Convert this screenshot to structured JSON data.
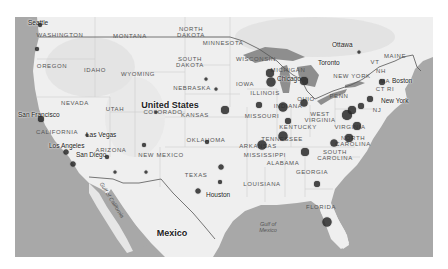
{
  "map": {
    "style": "grayscale",
    "colors": {
      "land": "#efefef",
      "water": "#a8a8a8",
      "lakes": "#8e8e8e",
      "border": "#555555",
      "marker": "#2a2a2a"
    },
    "country_labels": [
      {
        "text": "United States",
        "x": 170,
        "y": 105
      },
      {
        "text": "Mexico",
        "x": 172,
        "y": 233
      }
    ],
    "region_labels": [
      {
        "text": "WASHINGTON",
        "x": 60,
        "y": 35
      },
      {
        "text": "MONTANA",
        "x": 130,
        "y": 36
      },
      {
        "text": "OREGON",
        "x": 52,
        "y": 66
      },
      {
        "text": "IDAHO",
        "x": 95,
        "y": 70
      },
      {
        "text": "WYOMING",
        "x": 138,
        "y": 74
      },
      {
        "text": "NEVADA",
        "x": 75,
        "y": 103
      },
      {
        "text": "UTAH",
        "x": 115,
        "y": 109
      },
      {
        "text": "COLORADO",
        "x": 163,
        "y": 112
      },
      {
        "text": "CALIFORNIA",
        "x": 57,
        "y": 132
      },
      {
        "text": "ARIZONA",
        "x": 111,
        "y": 150
      },
      {
        "text": "NEW MEXICO",
        "x": 161,
        "y": 155
      },
      {
        "text": "NORTH\nDAKOTA",
        "x": 191,
        "y": 32
      },
      {
        "text": "SOUTH\nDAKOTA",
        "x": 190,
        "y": 62
      },
      {
        "text": "NEBRASKA",
        "x": 192,
        "y": 88
      },
      {
        "text": "KANSAS",
        "x": 195,
        "y": 115
      },
      {
        "text": "OKLAHOMA",
        "x": 206,
        "y": 140
      },
      {
        "text": "TEXAS",
        "x": 196,
        "y": 175
      },
      {
        "text": "MINNESOTA",
        "x": 223,
        "y": 43
      },
      {
        "text": "IOWA",
        "x": 245,
        "y": 84
      },
      {
        "text": "MISSOURI",
        "x": 262,
        "y": 116
      },
      {
        "text": "ARKANSAS",
        "x": 258,
        "y": 146
      },
      {
        "text": "LOUISIANA",
        "x": 262,
        "y": 184
      },
      {
        "text": "WISCONSIN",
        "x": 256,
        "y": 59
      },
      {
        "text": "ILLINOIS",
        "x": 265,
        "y": 93
      },
      {
        "text": "MICHIGAN",
        "x": 288,
        "y": 70
      },
      {
        "text": "INDIANA",
        "x": 288,
        "y": 106
      },
      {
        "text": "OHIO",
        "x": 306,
        "y": 99
      },
      {
        "text": "KENTUCKY",
        "x": 298,
        "y": 127
      },
      {
        "text": "TENNESSEE",
        "x": 282,
        "y": 139
      },
      {
        "text": "MISSISSIPPI",
        "x": 265,
        "y": 155
      },
      {
        "text": "ALABAMA",
        "x": 283,
        "y": 163
      },
      {
        "text": "GEORGIA",
        "x": 312,
        "y": 172
      },
      {
        "text": "FLORIDA",
        "x": 321,
        "y": 207
      },
      {
        "text": "SOUTH\nCAROLINA",
        "x": 335,
        "y": 155
      },
      {
        "text": "NORTH\nCAROLINA",
        "x": 353,
        "y": 141
      },
      {
        "text": "VIRGINIA",
        "x": 350,
        "y": 127
      },
      {
        "text": "WEST\nVIRGINIA",
        "x": 320,
        "y": 117
      },
      {
        "text": "PENN",
        "x": 339,
        "y": 96
      },
      {
        "text": "NEW YORK",
        "x": 352,
        "y": 76
      },
      {
        "text": "VT",
        "x": 375,
        "y": 62
      },
      {
        "text": "NH",
        "x": 381,
        "y": 71
      },
      {
        "text": "MA",
        "x": 385,
        "y": 81
      },
      {
        "text": "CT RI",
        "x": 385,
        "y": 89
      },
      {
        "text": "NJ",
        "x": 377,
        "y": 110
      },
      {
        "text": "MAINE",
        "x": 395,
        "y": 56
      }
    ],
    "city_labels": [
      {
        "text": "Seattle",
        "x": 28,
        "y": 23
      },
      {
        "text": "San Francisco",
        "x": 18,
        "y": 115
      },
      {
        "text": "Los Angeles",
        "x": 49,
        "y": 146
      },
      {
        "text": "Las Vegas",
        "x": 86,
        "y": 135
      },
      {
        "text": "San Diego",
        "x": 76,
        "y": 155
      },
      {
        "text": "Houston",
        "x": 206,
        "y": 195
      },
      {
        "text": "Ottawa",
        "x": 332,
        "y": 45
      },
      {
        "text": "Toronto",
        "x": 318,
        "y": 63
      },
      {
        "text": "Chicago",
        "x": 277,
        "y": 79
      },
      {
        "text": "Boston",
        "x": 392,
        "y": 81
      },
      {
        "text": "New York",
        "x": 381,
        "y": 101
      }
    ],
    "water_labels": [
      {
        "text": "Gulf of\nMexico",
        "x": 268,
        "y": 227
      },
      {
        "text": "Gulf of California",
        "x": 112,
        "y": 200
      }
    ],
    "markers": [
      {
        "name": "seattle",
        "x": 40,
        "y": 25,
        "size": 4
      },
      {
        "name": "portland",
        "x": 37,
        "y": 49,
        "size": 4
      },
      {
        "name": "san-francisco",
        "x": 41,
        "y": 119,
        "size": 6
      },
      {
        "name": "los-angeles",
        "x": 66,
        "y": 152,
        "size": 5
      },
      {
        "name": "san-diego",
        "x": 73,
        "y": 164,
        "size": 5
      },
      {
        "name": "las-vegas",
        "x": 87,
        "y": 135,
        "size": 3
      },
      {
        "name": "phoenix",
        "x": 107,
        "y": 157,
        "size": 4
      },
      {
        "name": "tucson",
        "x": 115,
        "y": 172,
        "size": 3
      },
      {
        "name": "albuquerque",
        "x": 144,
        "y": 145,
        "size": 4
      },
      {
        "name": "el-paso",
        "x": 146,
        "y": 172,
        "size": 3
      },
      {
        "name": "denver",
        "x": 156,
        "y": 112,
        "size": 3
      },
      {
        "name": "omaha",
        "x": 216,
        "y": 89,
        "size": 3
      },
      {
        "name": "kansas-city",
        "x": 225,
        "y": 110,
        "size": 8
      },
      {
        "name": "oklahoma-city",
        "x": 207,
        "y": 142,
        "size": 4
      },
      {
        "name": "dallas",
        "x": 221,
        "y": 167,
        "size": 5
      },
      {
        "name": "san-antonio",
        "x": 198,
        "y": 191,
        "size": 5
      },
      {
        "name": "houston",
        "x": 220,
        "y": 182,
        "size": 4
      },
      {
        "name": "minneapolis",
        "x": 206,
        "y": 79,
        "size": 3
      },
      {
        "name": "chicago-north",
        "x": 270,
        "y": 73,
        "size": 8
      },
      {
        "name": "chicago",
        "x": 271,
        "y": 82,
        "size": 9
      },
      {
        "name": "detroit",
        "x": 304,
        "y": 81,
        "size": 8
      },
      {
        "name": "st-louis",
        "x": 259,
        "y": 105,
        "size": 6
      },
      {
        "name": "indianapolis",
        "x": 283,
        "y": 107,
        "size": 9
      },
      {
        "name": "columbus",
        "x": 304,
        "y": 103,
        "size": 7
      },
      {
        "name": "louisville",
        "x": 288,
        "y": 121,
        "size": 6
      },
      {
        "name": "nashville",
        "x": 283,
        "y": 136,
        "size": 9
      },
      {
        "name": "memphis",
        "x": 262,
        "y": 145,
        "size": 9
      },
      {
        "name": "atlanta",
        "x": 305,
        "y": 152,
        "size": 8
      },
      {
        "name": "charlotte",
        "x": 334,
        "y": 143,
        "size": 7
      },
      {
        "name": "raleigh",
        "x": 349,
        "y": 138,
        "size": 8
      },
      {
        "name": "norfolk",
        "x": 357,
        "y": 126,
        "size": 8
      },
      {
        "name": "jacksonville",
        "x": 317,
        "y": 184,
        "size": 6
      },
      {
        "name": "miami",
        "x": 327,
        "y": 222,
        "size": 9
      },
      {
        "name": "washington-dc",
        "x": 347,
        "y": 115,
        "size": 10
      },
      {
        "name": "baltimore",
        "x": 352,
        "y": 110,
        "size": 8
      },
      {
        "name": "philadelphia",
        "x": 361,
        "y": 106,
        "size": 6
      },
      {
        "name": "new-york",
        "x": 370,
        "y": 99,
        "size": 6
      },
      {
        "name": "boston",
        "x": 382,
        "y": 82,
        "size": 6
      },
      {
        "name": "ottawa",
        "x": 359,
        "y": 52,
        "size": 3
      }
    ]
  }
}
